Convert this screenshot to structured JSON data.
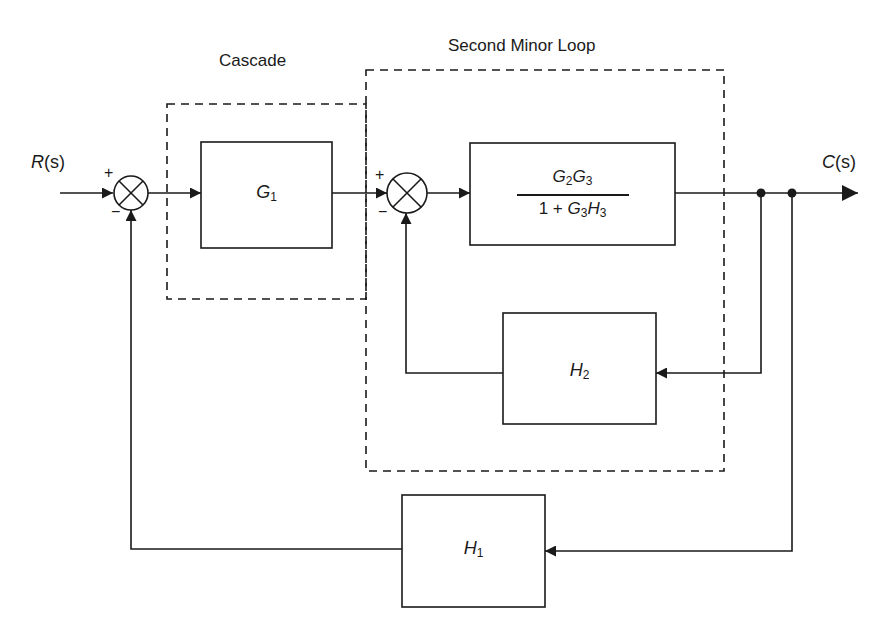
{
  "regions": {
    "cascade": {
      "title": "Cascade"
    },
    "second_minor_loop": {
      "title": "Second Minor Loop"
    }
  },
  "signals": {
    "input": {
      "name": "R",
      "arg": "(s)"
    },
    "output": {
      "name": "C",
      "arg": "(s)"
    }
  },
  "junctions": [
    {
      "id": "sum1",
      "plus": "+",
      "minus": "−"
    },
    {
      "id": "sum2",
      "plus": "+",
      "minus": "−"
    }
  ],
  "blocks": {
    "g1": {
      "symbol": "G",
      "sub": "1"
    },
    "forward": {
      "numerator": {
        "a": "G",
        "a_sub": "2",
        "b": "G",
        "b_sub": "3"
      },
      "denominator": {
        "lead": "1 + ",
        "a": "G",
        "a_sub": "3",
        "b": "H",
        "b_sub": "3"
      }
    },
    "h2": {
      "symbol": "H",
      "sub": "2"
    },
    "h1": {
      "symbol": "H",
      "sub": "1"
    }
  },
  "colors": {
    "stroke": "#1a1a1a",
    "background": "#ffffff"
  }
}
